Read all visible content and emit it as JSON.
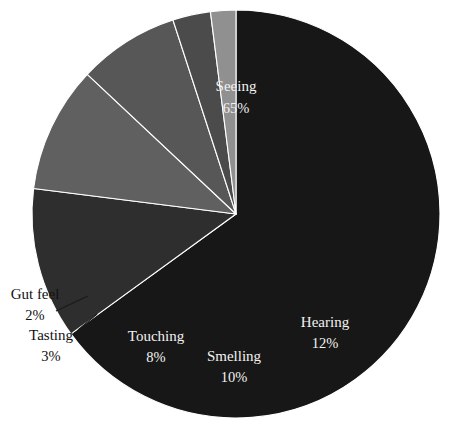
{
  "chart_data": {
    "type": "pie",
    "title": "",
    "subtitle": "",
    "xlabel": "",
    "ylabel": "",
    "grid": false,
    "legend_position": "none",
    "label_format": "name + percent",
    "start_angle_deg": 0,
    "direction": "clockwise",
    "total_percent": 100,
    "categories": [
      "Seeing",
      "Hearing",
      "Smelling",
      "Touching",
      "Tasting",
      "Gut feel"
    ],
    "values": [
      65,
      12,
      10,
      8,
      3,
      2
    ],
    "slices": [
      {
        "name": "Seeing",
        "value": 65,
        "percent_label": "65%",
        "color": "#171717",
        "label_placement": "inside",
        "label_x": 236,
        "label_y": 88,
        "pct_x": 236,
        "pct_y": 110
      },
      {
        "name": "Hearing",
        "value": 12,
        "percent_label": "12%",
        "color": "#2e2e2e",
        "label_placement": "inside",
        "label_x": 325,
        "label_y": 324,
        "pct_x": 325,
        "pct_y": 345
      },
      {
        "name": "Smelling",
        "value": 10,
        "percent_label": "10%",
        "color": "#606060",
        "label_placement": "inside",
        "label_x": 234,
        "label_y": 358,
        "pct_x": 234,
        "pct_y": 379
      },
      {
        "name": "Touching",
        "value": 8,
        "percent_label": "8%",
        "color": "#575757",
        "label_placement": "inside",
        "label_x": 156,
        "label_y": 338,
        "pct_x": 156,
        "pct_y": 359
      },
      {
        "name": "Tasting",
        "value": 3,
        "percent_label": "3%",
        "color": "#4b4b4b",
        "label_placement": "outside",
        "label_x": 51,
        "label_y": 337,
        "pct_x": 51,
        "pct_y": 358,
        "leader": "M 78 330 L 97 314"
      },
      {
        "name": "Gut feel",
        "value": 2,
        "percent_label": "2%",
        "color": "#909090",
        "label_placement": "outside",
        "label_x": 35,
        "label_y": 296,
        "pct_x": 35,
        "pct_y": 317,
        "leader": "M 56 311 L 88 296"
      }
    ],
    "geometry": {
      "center_x": 236,
      "center_y": 214,
      "radius": 204
    },
    "background_color": "#ffffff"
  }
}
